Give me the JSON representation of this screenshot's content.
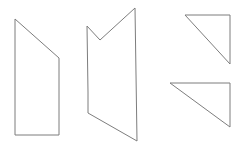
{
  "canvas": {
    "width": 244,
    "height": 149,
    "background_color": "#ffffff",
    "stroke_color": "#7d7d7d",
    "stroke_width": 1,
    "fill": "none"
  },
  "figure": {
    "title": "",
    "shape_count": 4
  },
  "shapes": [
    {
      "id": "shape-1",
      "name": "right-trapezoid",
      "sides": 4,
      "points": "15,19 59,58 59,135 15,135",
      "vertices": [
        {
          "x": 15,
          "y": 19
        },
        {
          "x": 59,
          "y": 58
        },
        {
          "x": 59,
          "y": 135
        },
        {
          "x": 15,
          "y": 135
        }
      ],
      "bbox": {
        "x": 15,
        "y": 19,
        "width": 44,
        "height": 116
      }
    },
    {
      "id": "shape-2",
      "name": "notched-arrow-polygon",
      "sides": 6,
      "points": "87,26 100,40 135,8 137,141 88,113 88,92",
      "vertices": [
        {
          "x": 87,
          "y": 26
        },
        {
          "x": 100,
          "y": 40
        },
        {
          "x": 135,
          "y": 8
        },
        {
          "x": 137,
          "y": 141
        },
        {
          "x": 88,
          "y": 113
        },
        {
          "x": 88,
          "y": 92
        }
      ],
      "bbox": {
        "x": 87,
        "y": 8,
        "width": 50,
        "height": 133
      }
    },
    {
      "id": "shape-3",
      "name": "upper-right-triangle",
      "sides": 3,
      "points": "185,15 230,15 230,64",
      "vertices": [
        {
          "x": 185,
          "y": 15
        },
        {
          "x": 230,
          "y": 15
        },
        {
          "x": 230,
          "y": 64
        }
      ],
      "bbox": {
        "x": 185,
        "y": 15,
        "width": 45,
        "height": 49
      }
    },
    {
      "id": "shape-4",
      "name": "lower-right-triangle",
      "sides": 3,
      "points": "170,83 230,83 230,127",
      "vertices": [
        {
          "x": 170,
          "y": 83
        },
        {
          "x": 230,
          "y": 83
        },
        {
          "x": 230,
          "y": 127
        }
      ],
      "bbox": {
        "x": 170,
        "y": 83,
        "width": 60,
        "height": 44
      }
    }
  ]
}
